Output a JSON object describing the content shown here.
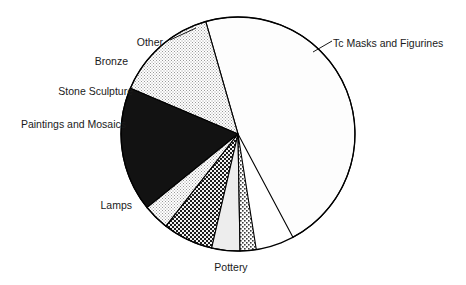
{
  "chart_data": {
    "type": "pie",
    "title": "",
    "subtitle": "",
    "xlabel": "",
    "ylabel": "",
    "legend_position": "none",
    "grid": false,
    "categories": [
      "Tc Masks and Figurines",
      "Pottery",
      "Lamps",
      "Paintings and Mosaics",
      "Stone Sculpture",
      "Bronze",
      "Other"
    ],
    "values": [
      46.7,
      14.2,
      17.2,
      3.6,
      6.9,
      3.9,
      2.2
    ],
    "unit": "percent",
    "total": 100,
    "slices": [
      {
        "label": "Tc Masks and Figurines",
        "value": 46.7,
        "angle_deg": 168.0,
        "start_deg": -62.0,
        "end_deg": 106.0,
        "fill": "#fdfdfd",
        "pattern": "solid-white",
        "label_anchor": "start",
        "label_x": 333,
        "label_y": 44
      },
      {
        "label": "Pottery",
        "value": 14.2,
        "angle_deg": 51.0,
        "start_deg": -113.0,
        "end_deg": -62.0,
        "fill": "#ececec",
        "pattern": "fine-dot",
        "label_anchor": "middle",
        "label_x": 231,
        "label_y": 268
      },
      {
        "label": "Lamps",
        "value": 17.2,
        "angle_deg": 62.0,
        "start_deg": -175.0,
        "end_deg": -113.0,
        "fill": "#121212",
        "pattern": "solid-black",
        "label_anchor": "end",
        "label_x": 132,
        "label_y": 206
      },
      {
        "label": "Paintings and Mosaics",
        "value": 3.6,
        "angle_deg": 13.0,
        "start_deg": 172.0,
        "end_deg": -175.0,
        "fill": "#e4e4e4",
        "pattern": "fine-dot",
        "label_anchor": "end",
        "label_x": 126,
        "label_y": 125
      },
      {
        "label": "Stone Sculpture",
        "value": 6.9,
        "angle_deg": 25.0,
        "start_deg": 147.0,
        "end_deg": 172.0,
        "fill": "#2b2b2b",
        "pattern": "checker",
        "label_anchor": "end",
        "label_x": 133,
        "label_y": 92
      },
      {
        "label": "Bronze",
        "value": 3.9,
        "angle_deg": 14.0,
        "start_deg": 133.0,
        "end_deg": 147.0,
        "fill": "#ededed",
        "pattern": "solid-light",
        "label_anchor": "end",
        "label_x": 128,
        "label_y": 62
      },
      {
        "label": "Other",
        "value": 2.2,
        "angle_deg": 8.0,
        "start_deg": 125.0,
        "end_deg": 133.0,
        "fill": "#d8d8d8",
        "pattern": "coarse-dot",
        "label_anchor": "end",
        "label_x": 163,
        "label_y": 43
      }
    ],
    "geometry": {
      "center_x": 238,
      "center_y": 134,
      "radius": 117
    },
    "colors": {
      "outline": "#000000",
      "background": "#ffffff",
      "text": "#1a1a1a"
    }
  }
}
